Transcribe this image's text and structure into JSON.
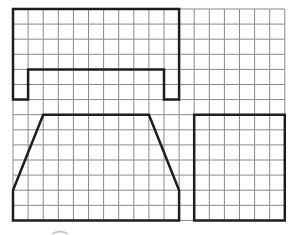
{
  "diagram": {
    "title": "",
    "type": "grid-shapes",
    "grid": {
      "origin_px": [
        13,
        9
      ],
      "cell_px": 15.1,
      "cols": 18,
      "rows": 14,
      "line_color": "#8a8a8a",
      "line_width": 1
    },
    "shape_style": {
      "stroke": "#1e1e1e",
      "stroke_width": 2.5
    },
    "shapes": [
      {
        "name": "bridge-shape",
        "points": [
          [
            0,
            0
          ],
          [
            11,
            0
          ],
          [
            11,
            6
          ],
          [
            10,
            6
          ],
          [
            10,
            4
          ],
          [
            1,
            4
          ],
          [
            1,
            6
          ],
          [
            0,
            6
          ]
        ]
      },
      {
        "name": "trapezoid-shape",
        "points": [
          [
            2,
            7
          ],
          [
            9,
            7
          ],
          [
            11,
            12
          ],
          [
            11,
            14
          ],
          [
            0,
            14
          ],
          [
            0,
            12
          ]
        ]
      },
      {
        "name": "rectangle-shape",
        "points": [
          [
            12,
            7
          ],
          [
            18,
            7
          ],
          [
            18,
            14
          ],
          [
            12,
            14
          ]
        ]
      }
    ],
    "artifact": {
      "color": "#c8c8c8"
    }
  }
}
